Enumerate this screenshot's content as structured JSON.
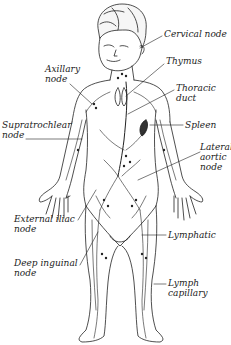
{
  "diagram": {
    "type": "anatomical-illustration",
    "colors": {
      "ink": "#222222",
      "background": "#ffffff",
      "spleen": "#333333"
    },
    "labels": [
      {
        "id": "cervical-node",
        "lines": [
          "Cervical node"
        ],
        "side": "right"
      },
      {
        "id": "thymus",
        "lines": [
          "Thymus"
        ],
        "side": "right"
      },
      {
        "id": "axillary-node",
        "lines": [
          "Axillary",
          "node"
        ],
        "side": "left"
      },
      {
        "id": "thoracic-duct",
        "lines": [
          "Thoracic",
          "duct"
        ],
        "side": "right"
      },
      {
        "id": "supratrochlear-node",
        "lines": [
          "Supratrochlear",
          "node"
        ],
        "side": "left"
      },
      {
        "id": "spleen",
        "lines": [
          "Spleen"
        ],
        "side": "right"
      },
      {
        "id": "lateral-aortic-node",
        "lines": [
          "Lateral",
          "aortic",
          "node"
        ],
        "side": "right"
      },
      {
        "id": "external-iliac-node",
        "lines": [
          "External iliac",
          "node"
        ],
        "side": "left"
      },
      {
        "id": "lymphatic",
        "lines": [
          "Lymphatic"
        ],
        "side": "right"
      },
      {
        "id": "deep-inguinal-node",
        "lines": [
          "Deep inguinal",
          "node"
        ],
        "side": "left"
      },
      {
        "id": "lymph-capillary",
        "lines": [
          "Lymph",
          "capillary"
        ],
        "side": "right"
      }
    ]
  }
}
